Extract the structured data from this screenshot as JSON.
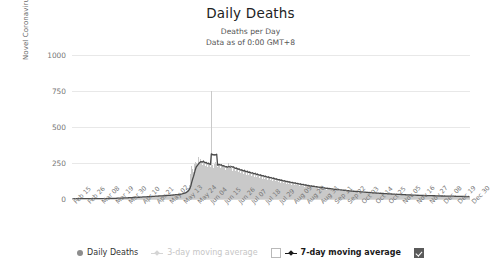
{
  "chart_data": {
    "type": "bar",
    "title": "Daily Deaths",
    "subtitle_line1": "Deaths per Day",
    "subtitle_line2": "Data as of 0:00 GMT+8",
    "xlabel": "",
    "ylabel": "Novel Coronavirus Daily Deaths",
    "ylim": [
      0,
      1000
    ],
    "yticks": [
      1000,
      750,
      500,
      250,
      0
    ],
    "grid": true,
    "legend_position": "bottom",
    "tick_labels": [
      "Feb 15",
      "Feb 26",
      "Mar 08",
      "Mar 19",
      "Mar 30",
      "Apr 10",
      "Apr 21",
      "May 02",
      "May 13",
      "May 24",
      "Jun 04",
      "Jun 15",
      "Jun 26",
      "Jul 07",
      "Jul 18",
      "Jul 29",
      "Aug 09",
      "Aug 20",
      "Aug 31",
      "Sep 11",
      "Sep 22",
      "Oct 03",
      "Oct 14",
      "Oct 25",
      "Nov 05",
      "Nov 16",
      "Nov 27",
      "Dec 08",
      "Dec 19",
      "Dec 30"
    ],
    "series": [
      {
        "name": "Daily Deaths",
        "type": "bar",
        "color": "#c9c9c9",
        "values": [
          2,
          1,
          2,
          1,
          2,
          3,
          1,
          2,
          1,
          2,
          1,
          2,
          3,
          2,
          1,
          2,
          1,
          3,
          2,
          1,
          2,
          3,
          2,
          1,
          2,
          1,
          2,
          3,
          2,
          1,
          2,
          1,
          2,
          3,
          2,
          4,
          3,
          2,
          4,
          3,
          5,
          4,
          3,
          5,
          4,
          6,
          5,
          4,
          6,
          5,
          7,
          6,
          5,
          7,
          8,
          6,
          7,
          9,
          8,
          7,
          9,
          8,
          10,
          9,
          11,
          10,
          9,
          12,
          11,
          10,
          13,
          12,
          11,
          14,
          13,
          12,
          15,
          14,
          16,
          15,
          14,
          17,
          16,
          15,
          18,
          17,
          16,
          19,
          18,
          20,
          19,
          18,
          21,
          20,
          22,
          21,
          20,
          23,
          22,
          24,
          23,
          22,
          25,
          24,
          26,
          25,
          24,
          27,
          26,
          28,
          27,
          30,
          29,
          28,
          31,
          30,
          33,
          32,
          31,
          35,
          34,
          36,
          38,
          40,
          42,
          45,
          48,
          52,
          58,
          65,
          78,
          95,
          120,
          175,
          230,
          210,
          190,
          240,
          260,
          250,
          230,
          290,
          265,
          240,
          280,
          255,
          235,
          270,
          250,
          230,
          260,
          245,
          225,
          255,
          240,
          220,
          750,
          235,
          215,
          245,
          230,
          260,
          240,
          220,
          250,
          235,
          215,
          245,
          228,
          208,
          238,
          222,
          202,
          232,
          215,
          250,
          225,
          205,
          235,
          218,
          198,
          228,
          212,
          192,
          222,
          206,
          186,
          216,
          200,
          180,
          210,
          195,
          175,
          205,
          190,
          170,
          200,
          185,
          165,
          195,
          180,
          160,
          190,
          175,
          155,
          185,
          170,
          150,
          180,
          165,
          148,
          175,
          160,
          142,
          170,
          156,
          138,
          165,
          152,
          134,
          160,
          148,
          130,
          155,
          143,
          126,
          150,
          138,
          122,
          145,
          134,
          118,
          140,
          130,
          114,
          136,
          126,
          110,
          132,
          122,
          106,
          128,
          118,
          103,
          124,
          114,
          100,
          120,
          111,
          97,
          116,
          107,
          94,
          112,
          104,
          91,
          108,
          100,
          88,
          105,
          97,
          85,
          101,
          94,
          82,
          98,
          91,
          80,
          95,
          88,
          77,
          92,
          85,
          75,
          89,
          82,
          72,
          86,
          80,
          70,
          83,
          77,
          68,
          80,
          75,
          66,
          78,
          72,
          64,
          75,
          70,
          62,
          73,
          68,
          60,
          70,
          66,
          58,
          68,
          64,
          56,
          66,
          62,
          54,
          64,
          60,
          52,
          62,
          58,
          51,
          60,
          56,
          49,
          58,
          55,
          48,
          56,
          53,
          46,
          55,
          51,
          45,
          53,
          50,
          44,
          51,
          48,
          42,
          50,
          47,
          41,
          48,
          45,
          40,
          47,
          44,
          38,
          45,
          42,
          37,
          44,
          41,
          36,
          43,
          40,
          35,
          41,
          38,
          34,
          40,
          37,
          33,
          39,
          36,
          32,
          38,
          35,
          31,
          36,
          34,
          30,
          35,
          33,
          29,
          34,
          32,
          28,
          33,
          31,
          27,
          32,
          30,
          27,
          31,
          29,
          26,
          30,
          28,
          25,
          29,
          27,
          25,
          28,
          27,
          24,
          28,
          26,
          23,
          27,
          25,
          23,
          26,
          25,
          22,
          26,
          24,
          22,
          25,
          24,
          21,
          25,
          23,
          21,
          24,
          23,
          20,
          24,
          22,
          20,
          23,
          22,
          19,
          23,
          21,
          19,
          22,
          21,
          19,
          22,
          20,
          18,
          21,
          20,
          18,
          21,
          20,
          17,
          20,
          19,
          17,
          20,
          19,
          17,
          19,
          18,
          16,
          19,
          18,
          16,
          18,
          17,
          16,
          18,
          17,
          15,
          18,
          17
        ]
      },
      {
        "name": "7-day moving average",
        "type": "line",
        "color": "#4a4a4a",
        "enabled": true,
        "peak_value": 280,
        "peak_label": "Jun 15"
      },
      {
        "name": "3-day moving average",
        "type": "line",
        "color": "#d5d5d5",
        "enabled": false
      }
    ]
  },
  "legend": {
    "items": [
      {
        "label": "Daily Deaths",
        "marker": "dot",
        "state": "on"
      },
      {
        "label": "3-day moving average",
        "marker": "line",
        "state": "dim"
      },
      {
        "label": "7-day moving average",
        "marker": "line",
        "state": "on"
      }
    ],
    "checkbox_unchecked_name": "seven-day-checkbox-left",
    "checkbox_checked_name": "seven-day-checkbox-right"
  }
}
